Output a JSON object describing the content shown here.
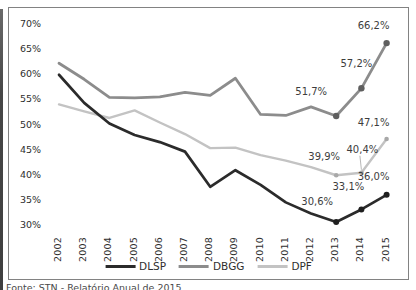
{
  "caption": "Fonte: STN - Relatório Anual de 2015",
  "chart_data": {
    "type": "line",
    "title": "",
    "xlabel": "",
    "ylabel": "",
    "x": [
      "2002",
      "2003",
      "2004",
      "2005",
      "2006",
      "2007",
      "2008",
      "2009",
      "2010",
      "2011",
      "2012",
      "2013",
      "2014",
      "2015"
    ],
    "series": [
      {
        "name": "DLSP",
        "color": "#2b2b2b",
        "marker_color": "#1f1f1f",
        "stroke_width": 2.7,
        "marker_radius": 3,
        "values": [
          59.9,
          54.3,
          50.2,
          47.9,
          46.5,
          44.6,
          37.6,
          40.9,
          38.0,
          34.5,
          32.3,
          30.6,
          33.1,
          36.0
        ]
      },
      {
        "name": "DBGG",
        "color": "#8c8c8c",
        "marker_color": "#5f5f5f",
        "stroke_width": 2.8,
        "marker_radius": 3.2,
        "values": [
          62.2,
          59.0,
          55.4,
          55.3,
          55.5,
          56.4,
          55.8,
          59.2,
          52.0,
          51.8,
          53.5,
          51.7,
          57.2,
          66.2
        ]
      },
      {
        "name": "DPF",
        "color": "#c3c3c3",
        "marker_color": "#a8a8a8",
        "stroke_width": 2.4,
        "marker_radius": 2.3,
        "values": [
          54.0,
          52.6,
          51.3,
          52.8,
          50.4,
          48.1,
          45.3,
          45.4,
          43.9,
          42.8,
          41.5,
          39.9,
          40.4,
          47.1
        ]
      }
    ],
    "ylim": [
      30,
      70
    ],
    "y_tick_step": 5,
    "y_tick_suffix": "%",
    "grid": false,
    "legend_position": "bottom",
    "marker_from_index": 11,
    "annotations": [
      {
        "series": "DBGG",
        "x_index": 11,
        "text": "51,7%",
        "dx": -25,
        "dy": -25
      },
      {
        "series": "DBGG",
        "x_index": 12,
        "text": "57,2%",
        "dx": -5,
        "dy": -25
      },
      {
        "series": "DBGG",
        "x_index": 13,
        "text": "66,2%",
        "dx": -13,
        "dy": -18
      },
      {
        "series": "DPF",
        "x_index": 11,
        "text": "39,9%",
        "dx": -12,
        "dy": -19
      },
      {
        "series": "DPF",
        "x_index": 12,
        "text": "40,4%",
        "dx": 1,
        "dy": -24,
        "leader": true
      },
      {
        "series": "DPF",
        "x_index": 13,
        "text": "47,1%",
        "dx": -13,
        "dy": -17
      },
      {
        "series": "DLSP",
        "x_index": 11,
        "text": "30,6%",
        "dx": -19,
        "dy": -21
      },
      {
        "series": "DLSP",
        "x_index": 12,
        "text": "33,1%",
        "dx": -13,
        "dy": -23
      },
      {
        "series": "DLSP",
        "x_index": 13,
        "text": "36,0%",
        "dx": -13,
        "dy": -19
      }
    ]
  }
}
